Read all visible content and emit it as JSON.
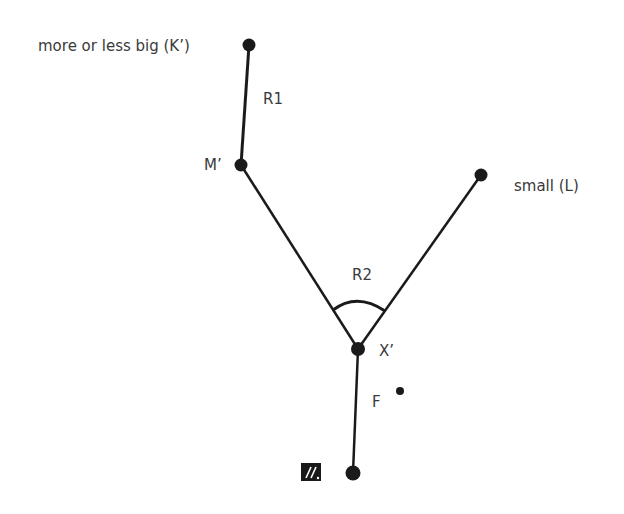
{
  "diagram": {
    "nodes": [
      {
        "id": "K",
        "label": "more or less big (K’)",
        "x": 249,
        "y": 45
      },
      {
        "id": "M",
        "label": "M’",
        "x": 241,
        "y": 165
      },
      {
        "id": "L",
        "label": "small (L)",
        "x": 481,
        "y": 175
      },
      {
        "id": "X",
        "label": "X’",
        "x": 358,
        "y": 349
      },
      {
        "id": "B",
        "label": "",
        "x": 353,
        "y": 473
      }
    ],
    "edges": [
      {
        "from": "K",
        "to": "M",
        "label": "R1"
      },
      {
        "from": "M",
        "to": "X",
        "label": ""
      },
      {
        "from": "L",
        "to": "X",
        "label": ""
      },
      {
        "from": "X",
        "to": "B",
        "label": "F"
      }
    ],
    "angle_label": "R2",
    "icon": "slashed-box-icon",
    "colors": {
      "line": "#1a1a1a",
      "text": "#3a3a3a",
      "background": "#ffffff"
    }
  }
}
